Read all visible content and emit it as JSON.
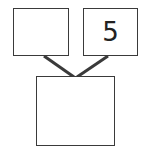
{
  "diagram": {
    "type": "number-bond",
    "boxes": {
      "left_part": {
        "value": ""
      },
      "right_part": {
        "value": "5"
      },
      "whole": {
        "value": ""
      }
    },
    "line_color": "#3a3a3a"
  }
}
